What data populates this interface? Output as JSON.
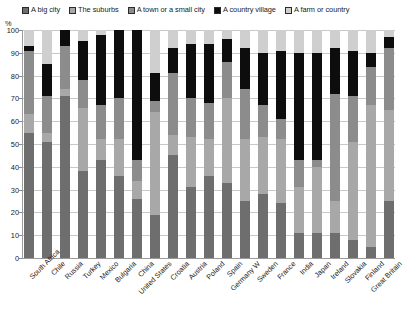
{
  "chart_data": {
    "type": "bar",
    "subtype": "stacked-bar-100",
    "title": "",
    "xlabel": "",
    "ylabel": "%",
    "ylim": [
      0,
      100
    ],
    "ytick_labels": [
      "0",
      "10",
      "20",
      "30",
      "40",
      "50",
      "60",
      "70",
      "80",
      "90",
      "100"
    ],
    "grid": true,
    "legend_position": "top",
    "categories": [
      "South Africa",
      "Chile",
      "Russia",
      "Turkey",
      "Mexico",
      "Bulgaria",
      "China",
      "United States",
      "Croatia",
      "Austria",
      "Poland",
      "Spain",
      "Germany W",
      "Sweden",
      "France",
      "India",
      "Japan",
      "Ireland",
      "Slovakia",
      "Finland",
      "Great Britain"
    ],
    "series": [
      {
        "name": "A big city",
        "color": "#6e6e6e",
        "values": [
          55,
          51,
          71,
          38,
          43,
          36,
          26,
          19,
          45,
          31,
          36,
          33,
          25,
          28,
          24,
          11,
          11,
          11,
          8,
          5,
          25
        ]
      },
      {
        "name": "The suburbs",
        "color": "#a8a8a8",
        "values": [
          8,
          4,
          3,
          28,
          9,
          16,
          8,
          45,
          9,
          22,
          16,
          37,
          27,
          25,
          28,
          20,
          29,
          14,
          43,
          62,
          40
        ]
      },
      {
        "name": "A town or a small city",
        "color": "#8c8c8c",
        "values": [
          28,
          16,
          19,
          12,
          15,
          18,
          9,
          5,
          27,
          17,
          16,
          16,
          22,
          14,
          9,
          12,
          3,
          47,
          20,
          17,
          27
        ]
      },
      {
        "name": "A country village",
        "color": "#0d0d0d",
        "values": [
          2,
          14,
          7,
          17,
          31,
          30,
          57,
          12,
          11,
          24,
          26,
          10,
          18,
          23,
          30,
          47,
          47,
          20,
          20,
          6,
          5
        ]
      },
      {
        "name": "A farm or country",
        "color": "#cfcfcf",
        "values": [
          7,
          15,
          0,
          5,
          2,
          0,
          0,
          19,
          8,
          6,
          6,
          4,
          8,
          10,
          9,
          10,
          10,
          8,
          9,
          10,
          3
        ]
      }
    ]
  },
  "legend": {
    "items": [
      {
        "label": "A big city",
        "swatch": "legend-swatch-big-city"
      },
      {
        "label": "The suburbs",
        "swatch": "legend-swatch-suburbs"
      },
      {
        "label": "A town or a small city",
        "swatch": "legend-swatch-town"
      },
      {
        "label": "A country village",
        "swatch": "legend-swatch-village"
      },
      {
        "label": "A farm or country",
        "swatch": "legend-swatch-farm"
      }
    ]
  },
  "axis": {
    "y_unit_label": "%"
  }
}
